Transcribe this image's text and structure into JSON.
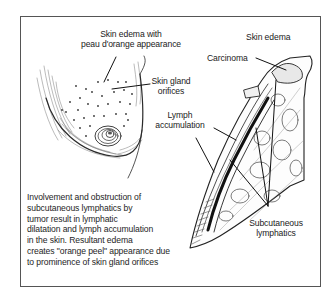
{
  "figure": {
    "labels": {
      "skin_edema_peau": [
        "Skin edema with",
        "peau d'orange appearance"
      ],
      "skin_edema": "Skin edema",
      "carcinoma": "Carcinoma",
      "skin_gland_orifices": [
        "Skin gland",
        "orifices"
      ],
      "lymph_accumulation": [
        "Lymph",
        "accumulation"
      ],
      "subcutaneous_lymphatics": [
        "Subcutaneous",
        "lymphatics"
      ]
    },
    "caption": [
      "Involvement and obstruction of",
      "subcutaneous lymphatics by",
      "tumor result in lymphatic",
      "dilatation and lymph accumulation",
      "in the skin.  Resultant edema",
      "creates \"orange peel\" appearance due",
      "to prominence of skin gland orifices"
    ],
    "colors": {
      "line": "#222222",
      "frame": "#555555",
      "background": "#ffffff"
    }
  }
}
